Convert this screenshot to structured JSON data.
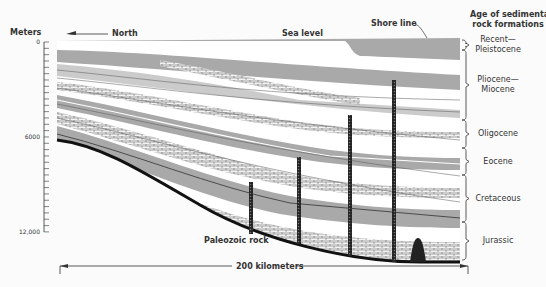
{
  "labels": {
    "axis_title": "Meters",
    "north": "North",
    "sea_level": "Sea level",
    "shore_line": "Shore line",
    "age_title_1": "Age of sedimentary",
    "age_title_2": "rock formations",
    "paleozoic": "Paleozoic rock",
    "scale": "200 kilometers"
  },
  "depth_ticks": [
    {
      "label": "0",
      "y": 42
    },
    {
      "label": "6000",
      "y": 137
    },
    {
      "label": "12,000",
      "y": 232
    }
  ],
  "ages": [
    {
      "line1": "Recent—",
      "line2": "Pleistocene",
      "top": 40,
      "bottom": 50
    },
    {
      "line1": "Pliocene—",
      "line2": "Miocene",
      "top": 50,
      "bottom": 120
    },
    {
      "line1": "Oligocene",
      "line2": "",
      "top": 120,
      "bottom": 148
    },
    {
      "line1": "Eocene",
      "line2": "",
      "top": 148,
      "bottom": 175
    },
    {
      "line1": "Cretaceous",
      "line2": "",
      "top": 175,
      "bottom": 222
    },
    {
      "line1": "Jurassic",
      "line2": "",
      "top": 222,
      "bottom": 260
    }
  ],
  "wells": [
    {
      "x": 251,
      "top": 182
    },
    {
      "x": 299,
      "top": 157
    },
    {
      "x": 350,
      "top": 115
    },
    {
      "x": 394,
      "top": 80
    }
  ],
  "colors": {
    "gray": "#a9a9a9",
    "dark": "#2b2b2b",
    "white": "#ffffff",
    "line": "#555555"
  }
}
